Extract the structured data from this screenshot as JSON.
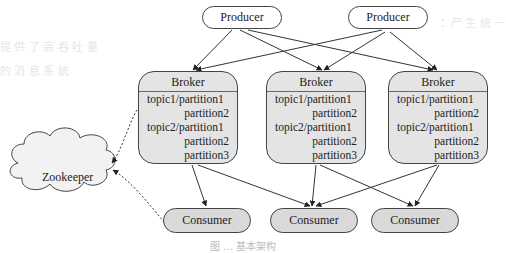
{
  "diagram": {
    "producers": [
      {
        "label": "Producer"
      },
      {
        "label": "Producer"
      }
    ],
    "brokers": [
      {
        "title": "Broker",
        "lines": [
          "topic1/partition1",
          "partition2",
          "topic2/partition1",
          "partition2",
          "partition3"
        ]
      },
      {
        "title": "Broker",
        "lines": [
          "topic1/partition1",
          "partition2",
          "topic2/partition1",
          "partition2",
          "partition3"
        ]
      },
      {
        "title": "Broker",
        "lines": [
          "topic1/partition1",
          "partition2",
          "topic2/partition1",
          "partition2",
          "partition3"
        ]
      }
    ],
    "consumers": [
      {
        "label": "Consumer"
      },
      {
        "label": "Consumer"
      },
      {
        "label": "Consumer"
      }
    ],
    "zookeeper": {
      "label": "Zookeeper"
    },
    "caption": "图 … 基本架构",
    "colors": {
      "consumer_fill": "#d9d9d9",
      "broker_fill": "#e4e4e4",
      "cloud_fill": "#f2f2f2",
      "stroke": "#444444"
    }
  }
}
